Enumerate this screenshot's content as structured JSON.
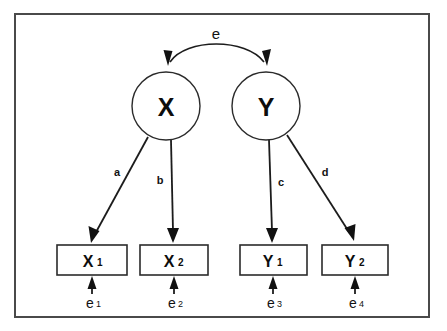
{
  "diagram": {
    "type": "path-diagram",
    "frame": {
      "name": "diagram-border"
    },
    "latent_variables": [
      {
        "id": "X",
        "label": "X",
        "cx": 166,
        "cy": 106,
        "r": 34
      },
      {
        "id": "Y",
        "label": "Y",
        "cx": 266,
        "cy": 106,
        "r": 34
      }
    ],
    "indicators": [
      {
        "id": "X1",
        "base": "X",
        "sub": "1",
        "x": 57,
        "y": 245,
        "w": 70,
        "h": 30
      },
      {
        "id": "X2",
        "base": "X",
        "sub": "2",
        "x": 140,
        "y": 245,
        "w": 68,
        "h": 30
      },
      {
        "id": "Y1",
        "base": "Y",
        "sub": "1",
        "x": 240,
        "y": 245,
        "w": 67,
        "h": 30
      },
      {
        "id": "Y2",
        "base": "Y",
        "sub": "2",
        "x": 322,
        "y": 245,
        "w": 66,
        "h": 30
      }
    ],
    "loadings": [
      {
        "id": "a",
        "label": "a",
        "from": "X",
        "to": "X1",
        "label_x": 117,
        "label_y": 172
      },
      {
        "id": "b",
        "label": "b",
        "from": "X",
        "to": "X2",
        "label_x": 160,
        "label_y": 180
      },
      {
        "id": "c",
        "label": "c",
        "from": "Y",
        "to": "Y1",
        "label_x": 281,
        "label_y": 182
      },
      {
        "id": "d",
        "label": "d",
        "from": "Y",
        "to": "Y2",
        "label_x": 325,
        "label_y": 172
      }
    ],
    "correlation": {
      "id": "e",
      "label": "e",
      "between": [
        "X",
        "Y"
      ],
      "label_x": 216,
      "label_y": 33,
      "double_headed": true
    },
    "errors": [
      {
        "id": "e1",
        "base": "e",
        "sub": "1",
        "to": "X1",
        "x": 92,
        "label_y": 303
      },
      {
        "id": "e2",
        "base": "e",
        "sub": "2",
        "to": "X2",
        "x": 174,
        "label_y": 303
      },
      {
        "id": "e3",
        "base": "e",
        "sub": "3",
        "to": "Y1",
        "x": 273,
        "label_y": 303
      },
      {
        "id": "e4",
        "base": "e",
        "sub": "4",
        "to": "Y2",
        "x": 355,
        "label_y": 303
      }
    ],
    "colors": {
      "background": "#ffffff",
      "stroke": "#1c1c1c",
      "frame": "#4a4a4a",
      "text": "#0d0d0d"
    }
  }
}
